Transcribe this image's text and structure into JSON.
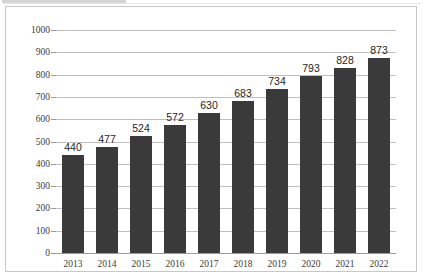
{
  "chart_data": {
    "type": "bar",
    "title": "",
    "subtitle": "",
    "xlabel": "",
    "ylabel": "",
    "categories": [
      "2013",
      "2014",
      "2015",
      "2016",
      "2017",
      "2018",
      "2019",
      "2020",
      "2021",
      "2022"
    ],
    "values": [
      440,
      477,
      524,
      572,
      630,
      683,
      734,
      793,
      828,
      873
    ],
    "data_labels": [
      "440",
      "477",
      "524",
      "572",
      "630",
      "683",
      "734",
      "793",
      "828",
      "873"
    ],
    "ylim": [
      0,
      1000
    ],
    "ytick_step": 100,
    "ytick_labels": [
      "1000",
      "900",
      "800",
      "700",
      "600",
      "500",
      "400",
      "300",
      "200",
      "100",
      "0"
    ],
    "ytick_values": [
      1000,
      900,
      800,
      700,
      600,
      500,
      400,
      300,
      200,
      100,
      0
    ],
    "grid": true,
    "legend": false,
    "legend_position": "none",
    "series": [
      {
        "name": "",
        "values": [
          440,
          477,
          524,
          572,
          630,
          683,
          734,
          793,
          828,
          873
        ],
        "color": "#3a3a3a"
      }
    ],
    "colors": {
      "bar": "#3a3a3a",
      "gridline": "#bfbfbf",
      "axis": "#9a9a9a",
      "border": "#c8c8c8",
      "background": "#ffffff",
      "tick_text": "#3b3b3b",
      "value_text": "#262626"
    }
  }
}
